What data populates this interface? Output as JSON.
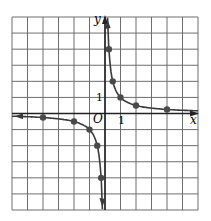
{
  "graph": {
    "function": "y = 1/x",
    "x_label": "x",
    "y_label": "y",
    "origin_label": "O",
    "x_tick_label": "1",
    "y_tick_label": "1",
    "grid": {
      "cols": 12,
      "rows": 12,
      "xmin": -6,
      "xmax": 6,
      "ymin": -6,
      "ymax": 6
    },
    "colors": {
      "grid": "#6e6e6e",
      "curve": "#3a3a3a",
      "point": "#4a4a4a",
      "axis": "#222222"
    }
  },
  "chart_data": {
    "type": "line",
    "title": "",
    "xlabel": "x",
    "ylabel": "y",
    "xlim": [
      -6,
      6
    ],
    "ylim": [
      -6,
      6
    ],
    "grid": true,
    "series": [
      {
        "name": "y=1/x (x>0)",
        "x": [
          0.25,
          0.5,
          1,
          2,
          4
        ],
        "y": [
          4,
          2,
          1,
          0.5,
          0.25
        ]
      },
      {
        "name": "y=1/x (x<0)",
        "x": [
          -4,
          -2,
          -1,
          -0.5,
          -0.25
        ],
        "y": [
          -0.25,
          -0.5,
          -1,
          -2,
          -4
        ]
      }
    ]
  }
}
